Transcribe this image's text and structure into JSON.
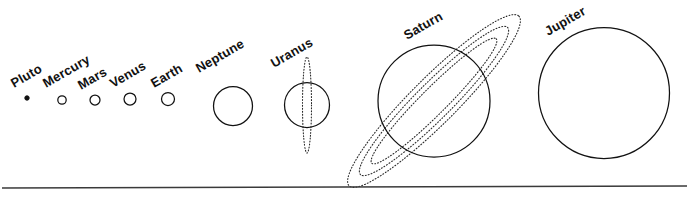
{
  "diagram": {
    "background_color": "#ffffff",
    "line_color": "#111111",
    "label_color": "#111111",
    "label_rotation_deg": -30,
    "baseline": {
      "name": "baseline-rule",
      "x1": 2,
      "y1": 188,
      "x2": 687,
      "y2": 186,
      "color": "#3a3a3a"
    },
    "planets": [
      {
        "label": "Pluto",
        "key": "pluto",
        "cx": 27,
        "cy": 98,
        "radius": 2.2,
        "fill": "solid",
        "label_x": 14,
        "label_y": 88,
        "rings": []
      },
      {
        "label": "Mercury",
        "key": "mercury",
        "cx": 62,
        "cy": 100,
        "radius": 4.2,
        "fill": "outline",
        "label_x": 46,
        "label_y": 88,
        "rings": []
      },
      {
        "label": "Mars",
        "key": "mars",
        "cx": 95,
        "cy": 100,
        "radius": 5.0,
        "fill": "outline",
        "label_x": 81,
        "label_y": 90,
        "rings": []
      },
      {
        "label": "Venus",
        "key": "venus",
        "cx": 130,
        "cy": 99,
        "radius": 6.0,
        "fill": "outline",
        "label_x": 113,
        "label_y": 88,
        "rings": []
      },
      {
        "label": "Earth",
        "key": "earth",
        "cx": 168,
        "cy": 99,
        "radius": 6.5,
        "fill": "outline",
        "label_x": 154,
        "label_y": 88,
        "rings": []
      },
      {
        "label": "Neptune",
        "key": "neptune",
        "cx": 233,
        "cy": 106,
        "radius": 19.5,
        "fill": "outline",
        "label_x": 199,
        "label_y": 73,
        "rings": []
      },
      {
        "label": "Uranus",
        "key": "uranus",
        "cx": 307,
        "cy": 105,
        "radius": 22.5,
        "fill": "outline",
        "label_x": 274,
        "label_y": 68,
        "rings": [
          {
            "rx": 4.5,
            "ry": 48,
            "rotate": 0
          }
        ]
      },
      {
        "label": "Saturn",
        "key": "saturn",
        "cx": 434,
        "cy": 101,
        "radius": 56,
        "fill": "outline",
        "label_x": 407,
        "label_y": 40,
        "rings": [
          {
            "rx": 120,
            "ry": 23,
            "rotate": -45
          },
          {
            "rx": 104,
            "ry": 18,
            "rotate": -45
          },
          {
            "rx": 88,
            "ry": 13,
            "rotate": -45
          }
        ]
      },
      {
        "label": "Jupiter",
        "key": "jupiter",
        "cx": 604,
        "cy": 93,
        "radius": 65.5,
        "fill": "outline",
        "label_x": 548,
        "label_y": 36,
        "rings": []
      }
    ]
  }
}
